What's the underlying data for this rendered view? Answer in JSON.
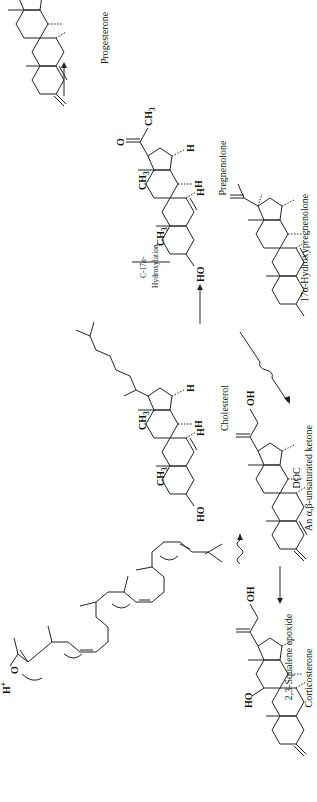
{
  "figure": {
    "orientation": "rotated-90-ccw",
    "compounds": [
      {
        "id": "squalene-epoxide",
        "name": "2,3-Squalene epoxide",
        "annotations": [
          "H⁺",
          "O"
        ]
      },
      {
        "id": "cholesterol",
        "name": "Cholesterol",
        "annotations": [
          "CH₃",
          "CH₃",
          "H",
          "H",
          "H",
          "HO"
        ]
      },
      {
        "id": "pregnenolone",
        "name": "Pregnenolone",
        "annotations": [
          "CH₃",
          "O",
          "CH₃",
          "CH₃",
          "H",
          "H",
          "H",
          "HO"
        ]
      },
      {
        "id": "progesterone",
        "name": "Progesterone",
        "annotations": [
          "CH₃",
          "O",
          "CH₃",
          "CH₃",
          "H",
          "H",
          "H",
          "O"
        ]
      },
      {
        "id": "hydroxypregnenolone",
        "name": "17α-Hydroxypregnenolone",
        "annotations": [
          "CH₃",
          "O",
          "OH",
          "CH₃",
          "CH₃",
          "H",
          "H",
          "H",
          "HO"
        ]
      },
      {
        "id": "doc",
        "name": "DOC",
        "subtitle": "An α,β-unsaturated ketone",
        "annotations": [
          "OH",
          "O",
          "CH₃",
          "CH₃",
          "H",
          "H",
          "H",
          "O"
        ]
      },
      {
        "id": "corticosterone",
        "name": "Corticosterone",
        "annotations": [
          "OH",
          "O",
          "CH₃",
          "CH₃",
          "H",
          "H",
          "H",
          "HO",
          "O"
        ]
      }
    ],
    "reactions": [
      {
        "from": "squalene-epoxide",
        "to": "cholesterol",
        "arrow": "wavy"
      },
      {
        "from": "cholesterol",
        "to": "pregnenolone",
        "arrow": "straight"
      },
      {
        "from": "pregnenolone",
        "to": "progesterone",
        "arrow": "straight"
      },
      {
        "from": "pregnenolone",
        "to": "hydroxypregnenolone",
        "arrow": "straight",
        "label_line1": "C-17α-",
        "label_line2": "Hydroxylation"
      },
      {
        "from": "pregnenolone",
        "to": "doc",
        "arrow": "wavy"
      },
      {
        "from": "doc",
        "to": "corticosterone",
        "arrow": "straight"
      }
    ],
    "atom_labels": {
      "ch3": "CH",
      "sub3": "3",
      "h": "H",
      "ho": "HO",
      "oh": "OH",
      "o": "O",
      "hplus": "H",
      "plus": "+"
    }
  }
}
